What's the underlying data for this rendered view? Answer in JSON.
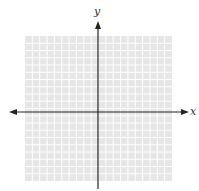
{
  "diagram": {
    "type": "coordinate-plane",
    "x_axis_label": "x",
    "y_axis_label": "y",
    "grid": {
      "columns": 20,
      "rows": 20,
      "background": "#e6e6e6",
      "line_color": "#ffffff"
    },
    "axis_color": "#222222"
  }
}
